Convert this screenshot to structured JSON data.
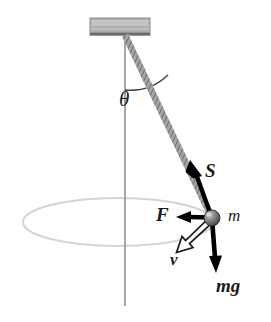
{
  "figure": {
    "type": "physics-diagram",
    "background_color": "#ffffff"
  },
  "labels": {
    "angle": "θ",
    "tension": "S",
    "centripetal_force": "F",
    "velocity": "v",
    "mass": "m",
    "weight": "mg"
  },
  "colors": {
    "block_fill": "#a9a9a9",
    "block_highlight": "#c9c9c9",
    "block_edge": "#6e6e6e",
    "string": "#555555",
    "axis_line": "#a8a8a8",
    "orbit_ellipse": "#d2d2d2",
    "bob_dark": "#4a4a4a",
    "bob_light": "#b8b8b8",
    "arrow_solid": "#000000",
    "arrow_hollow_fill": "#ffffff",
    "arrow_hollow_stroke": "#000000",
    "text": "#1a1a1a"
  },
  "geometry": {
    "canvas": {
      "width": 271,
      "height": 322
    },
    "ceiling_block": {
      "x": 90,
      "y": 18,
      "width": 60,
      "height": 17
    },
    "pivot": {
      "x": 125,
      "y": 35
    },
    "bob": {
      "x": 212,
      "y": 218,
      "radius": 8
    },
    "vertical_axis": {
      "x": 125,
      "y_top": 35,
      "y_bottom": 306
    },
    "angle_arc_radius": 55,
    "orbit_ellipse": {
      "cx": 118,
      "cy": 222,
      "rx": 95,
      "ry": 24
    }
  },
  "vectors": [
    {
      "name": "tension",
      "symbol": "S",
      "style": "solid-black",
      "from": [
        212,
        218
      ],
      "to": [
        192,
        163
      ]
    },
    {
      "name": "centripetal_force",
      "symbol": "F",
      "style": "solid-black",
      "from": [
        212,
        218
      ],
      "to": [
        178,
        217
      ]
    },
    {
      "name": "velocity",
      "symbol": "v",
      "style": "hollow-white",
      "from": [
        209,
        222
      ],
      "to": [
        177,
        252
      ]
    },
    {
      "name": "weight",
      "symbol": "mg",
      "style": "solid-black",
      "from": [
        212,
        219
      ],
      "to": [
        216,
        272
      ]
    }
  ],
  "label_positions": {
    "angle": [
      119,
      89
    ],
    "tension": [
      205,
      163
    ],
    "centripetal_force": [
      157,
      206
    ],
    "velocity": [
      171,
      251
    ],
    "mass": [
      228,
      206
    ],
    "weight": [
      218,
      276
    ]
  }
}
